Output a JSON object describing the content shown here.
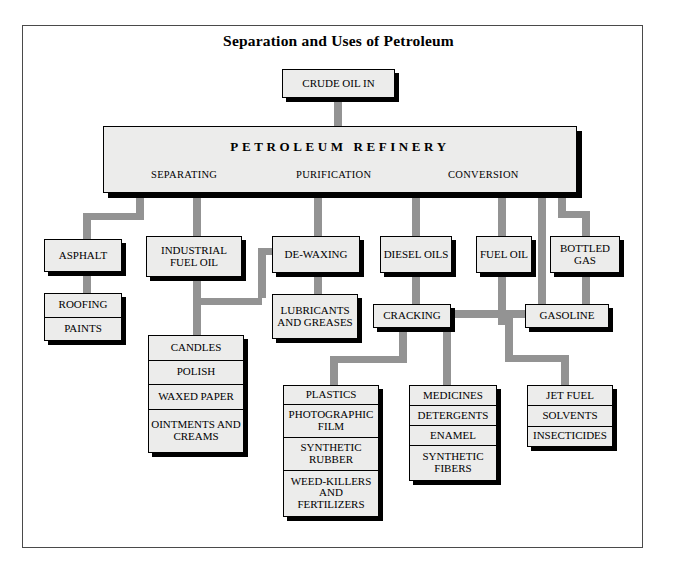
{
  "title": "Separation and Uses of Petroleum",
  "colors": {
    "box_fill": "#ececeb",
    "box_border": "#000000",
    "shadow": "#000000",
    "connector": "#939393",
    "frame": "#4a4a4a",
    "background": "#ffffff"
  },
  "nodes": {
    "crude_oil": "CRUDE OIL IN",
    "refinery_title": "PETROLEUM REFINERY",
    "refinery_sections": [
      "SEPARATING",
      "PURIFICATION",
      "CONVERSION"
    ],
    "asphalt": "ASPHALT",
    "industrial_fuel_oil": "INDUSTRIAL FUEL OIL",
    "de_waxing": "DE-WAXING",
    "diesel_oils": "DIESEL OILS",
    "fuel_oil": "FUEL OIL",
    "bottled_gas": "BOTTLED GAS",
    "lubricants": "LUBRICANTS AND GREASES",
    "cracking": "CRACKING",
    "gasoline": "GASOLINE"
  },
  "stacks": {
    "asphalt_products": [
      "ROOFING",
      "PAINTS"
    ],
    "wax_products": [
      "CANDLES",
      "POLISH",
      "WAXED PAPER",
      "OINTMENTS AND CREAMS"
    ],
    "plastics_products": [
      "PLASTICS",
      "PHOTOGRAPHIC FILM",
      "SYNTHETIC RUBBER",
      "WEED-KILLERS AND FERTILIZERS"
    ],
    "medicines_products": [
      "MEDICINES",
      "DETERGENTS",
      "ENAMEL",
      "SYNTHETIC FIBERS"
    ],
    "fuel_products": [
      "JET FUEL",
      "SOLVENTS",
      "INSECTICIDES"
    ]
  }
}
